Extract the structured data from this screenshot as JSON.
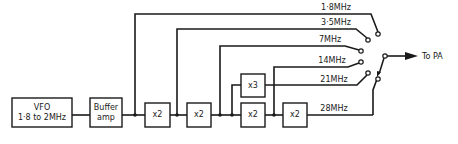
{
  "diagram": {
    "type": "block-diagram",
    "blocks": {
      "vfo": {
        "line1": "VFO",
        "line2": "1·8 to 2MHz"
      },
      "buffer": {
        "line1": "Buffer",
        "line2": "amp"
      },
      "mult1": {
        "label": "x2"
      },
      "mult2": {
        "label": "x2"
      },
      "mult3": {
        "label": "x3"
      },
      "mult4": {
        "label": "x2"
      },
      "mult5": {
        "label": "x2"
      }
    },
    "bands": [
      {
        "label": "1·8MHz"
      },
      {
        "label": "3·5MHz"
      },
      {
        "label": "7MHz"
      },
      {
        "label": "14MHz"
      },
      {
        "label": "21MHz"
      },
      {
        "label": "28MHz"
      }
    ],
    "output": {
      "label": "To PA"
    },
    "colors": {
      "line": "#1a1a1a",
      "background": "#ffffff"
    }
  }
}
